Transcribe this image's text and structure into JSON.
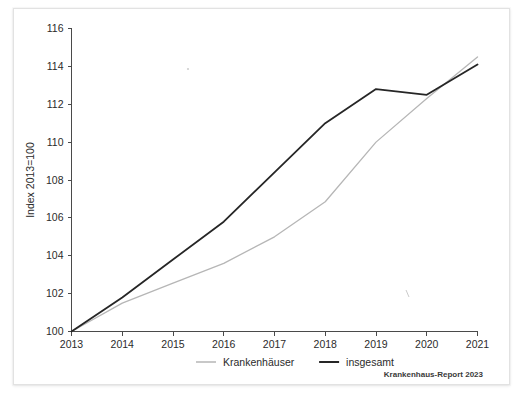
{
  "figure": {
    "source_note": "Krankenhaus-Report 2023"
  },
  "chart_data": {
    "type": "line",
    "title": "",
    "subtitle": "",
    "xlabel": "",
    "ylabel": "Index 2013=100",
    "x": [
      2013,
      2014,
      2015,
      2016,
      2017,
      2018,
      2019,
      2020,
      2021
    ],
    "xtick_labels": [
      "2013",
      "2014",
      "2015",
      "2016",
      "2017",
      "2018",
      "2019",
      "2020",
      "2021"
    ],
    "ytick_labels": [
      "100",
      "102",
      "104",
      "106",
      "108",
      "110",
      "112",
      "114",
      "116"
    ],
    "yticks": [
      100,
      102,
      104,
      106,
      108,
      110,
      112,
      114,
      116
    ],
    "xlim": [
      2013,
      2021
    ],
    "ylim": [
      100,
      116
    ],
    "grid": false,
    "legend_position": "bottom",
    "series": [
      {
        "name": "Krankenhäuser",
        "color": "#b6b6b6",
        "width": 1.3,
        "values": [
          100.0,
          101.5,
          102.55,
          103.6,
          105.0,
          106.85,
          110.0,
          112.3,
          114.5
        ]
      },
      {
        "name": "insgesamt",
        "color": "#262626",
        "width": 1.8,
        "values": [
          100.0,
          101.8,
          103.8,
          105.8,
          108.4,
          111.0,
          112.8,
          112.5,
          114.1
        ]
      }
    ]
  }
}
